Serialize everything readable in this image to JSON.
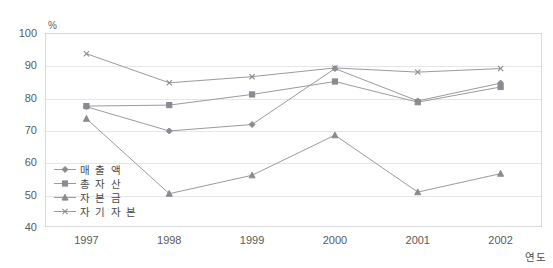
{
  "chart_data": {
    "type": "line",
    "title": "",
    "xlabel": "연도",
    "ylabel": "%",
    "categories": [
      "1997",
      "1998",
      "1999",
      "2000",
      "2001",
      "2002"
    ],
    "ylim": [
      40,
      100
    ],
    "yticks": [
      40,
      50,
      60,
      70,
      80,
      90,
      100
    ],
    "grid": true,
    "legend_position": "inside-lower-left",
    "series": [
      {
        "name": "매출액",
        "marker": "diamond",
        "color": "#8a8a92",
        "values": [
          77.2,
          69.7,
          71.7,
          89.0,
          79.0,
          84.5
        ]
      },
      {
        "name": "총자산",
        "marker": "square",
        "color": "#8a8a92",
        "values": [
          77.4,
          77.7,
          81.0,
          85.0,
          78.6,
          83.3
        ]
      },
      {
        "name": "자본금",
        "marker": "triangle",
        "color": "#8a8a92",
        "values": [
          73.5,
          50.3,
          56.0,
          68.4,
          50.8,
          56.5
        ]
      },
      {
        "name": "자기자본",
        "marker": "x",
        "color": "#8a8a92",
        "values": [
          93.6,
          84.6,
          86.5,
          89.2,
          87.9,
          89.0
        ]
      }
    ]
  },
  "axes": {
    "y_unit": "%",
    "y_tick_labels": [
      "100",
      "90",
      "80",
      "70",
      "60",
      "50",
      "40"
    ],
    "x_tick_labels": [
      "1997",
      "1998",
      "1999",
      "2000",
      "2001",
      "2002"
    ],
    "x_axis_title": "연도"
  },
  "legend": {
    "items": [
      {
        "label": "매 출 액",
        "marker": "diamond-marker"
      },
      {
        "label": "총 자 산",
        "marker": "square-marker"
      },
      {
        "label": "자 본 금",
        "marker": "triangle-marker"
      },
      {
        "label": "자 기 자 본",
        "marker": "x-marker"
      }
    ]
  }
}
